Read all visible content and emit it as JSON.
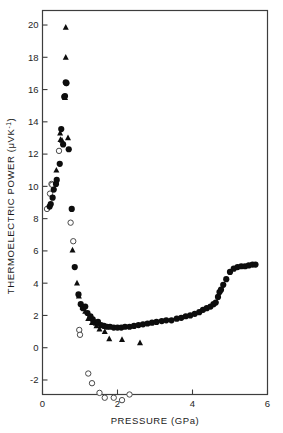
{
  "figure": {
    "title": "",
    "background": "#ffffff",
    "axis_color": "#3d3d3d",
    "marker_color": "#0d0d0d"
  },
  "axes": {
    "x": {
      "label": "PRESSURE (GPa)",
      "ticks": [
        0,
        2,
        4,
        6
      ],
      "tick_labels": [
        "0",
        "2",
        "4",
        "6"
      ],
      "min": 0,
      "max": 6
    },
    "y": {
      "label_text": "THERMOELECTRIC  POWER (",
      "label_unit_mu": "μ",
      "label_unit_rest": "VK",
      "label_unit_exp": "-1",
      "label_unit_close": ")",
      "label_full": "THERMOELECTRIC POWER (μVK⁻¹)",
      "ticks": [
        -2,
        0,
        2,
        4,
        6,
        8,
        10,
        12,
        14,
        16,
        18,
        20
      ],
      "tick_labels": [
        "-2",
        "0",
        "2",
        "4",
        "6",
        "8",
        "10",
        "12",
        "14",
        "16",
        "18",
        "20"
      ],
      "min": -2.9,
      "max": 20.9
    }
  },
  "chart_data": {
    "type": "scatter",
    "title": "",
    "xlabel": "PRESSURE (GPa)",
    "ylabel": "THERMOELECTRIC POWER (μVK⁻¹)",
    "xlim": [
      0,
      6
    ],
    "ylim": [
      -2.9,
      20.9
    ],
    "grid": false,
    "legend": "none",
    "series": [
      {
        "name": "filled-circles",
        "marker": "filled-circle",
        "color": "#0d0d0d",
        "points": [
          [
            0.19,
            8.75
          ],
          [
            0.22,
            8.9
          ],
          [
            0.27,
            9.3
          ],
          [
            0.3,
            9.8
          ],
          [
            0.36,
            10.15
          ],
          [
            0.38,
            10.4
          ],
          [
            0.46,
            11.4
          ],
          [
            0.5,
            13.55
          ],
          [
            0.55,
            12.6
          ],
          [
            0.58,
            15.55
          ],
          [
            0.6,
            15.6
          ],
          [
            0.62,
            16.45
          ],
          [
            0.64,
            16.4
          ],
          [
            0.7,
            12.3
          ],
          [
            0.78,
            8.6
          ],
          [
            0.86,
            5.0
          ],
          [
            0.96,
            3.3
          ],
          [
            1.02,
            2.7
          ],
          [
            1.08,
            2.45
          ],
          [
            1.14,
            2.55
          ],
          [
            1.2,
            2.15
          ],
          [
            1.28,
            1.95
          ],
          [
            1.34,
            1.75
          ],
          [
            1.4,
            1.55
          ],
          [
            1.48,
            1.6
          ],
          [
            1.56,
            1.4
          ],
          [
            1.64,
            1.35
          ],
          [
            1.72,
            1.3
          ],
          [
            1.8,
            1.3
          ],
          [
            1.9,
            1.25
          ],
          [
            2.0,
            1.25
          ],
          [
            2.1,
            1.25
          ],
          [
            2.2,
            1.3
          ],
          [
            2.32,
            1.3
          ],
          [
            2.44,
            1.35
          ],
          [
            2.56,
            1.4
          ],
          [
            2.68,
            1.45
          ],
          [
            2.8,
            1.5
          ],
          [
            2.92,
            1.55
          ],
          [
            3.04,
            1.6
          ],
          [
            3.18,
            1.65
          ],
          [
            3.3,
            1.7
          ],
          [
            3.44,
            1.7
          ],
          [
            3.58,
            1.8
          ],
          [
            3.7,
            1.85
          ],
          [
            3.82,
            1.95
          ],
          [
            3.94,
            2.0
          ],
          [
            4.06,
            2.1
          ],
          [
            4.18,
            2.2
          ],
          [
            4.28,
            2.35
          ],
          [
            4.38,
            2.45
          ],
          [
            4.48,
            2.55
          ],
          [
            4.56,
            2.7
          ],
          [
            4.62,
            2.8
          ],
          [
            4.68,
            3.15
          ],
          [
            4.72,
            3.45
          ],
          [
            4.76,
            3.6
          ],
          [
            4.82,
            3.9
          ],
          [
            4.9,
            4.25
          ],
          [
            5.0,
            4.7
          ],
          [
            5.1,
            4.9
          ],
          [
            5.2,
            5.0
          ],
          [
            5.3,
            5.05
          ],
          [
            5.4,
            5.05
          ],
          [
            5.5,
            5.1
          ],
          [
            5.6,
            5.15
          ],
          [
            5.68,
            5.15
          ]
        ]
      },
      {
        "name": "filled-triangles",
        "marker": "filled-triangle",
        "color": "#0d0d0d",
        "points": [
          [
            0.37,
            11.0
          ],
          [
            0.47,
            13.3
          ],
          [
            0.48,
            12.9
          ],
          [
            0.52,
            12.85
          ],
          [
            0.6,
            15.5
          ],
          [
            0.62,
            19.85
          ],
          [
            0.62,
            18.0
          ],
          [
            0.68,
            13.0
          ],
          [
            0.8,
            6.05
          ],
          [
            0.92,
            4.0
          ],
          [
            0.97,
            3.2
          ],
          [
            1.07,
            2.5
          ],
          [
            1.14,
            2.25
          ],
          [
            1.22,
            1.8
          ],
          [
            1.32,
            1.55
          ],
          [
            1.44,
            1.35
          ],
          [
            1.52,
            1.15
          ],
          [
            1.66,
            1.0
          ],
          [
            1.78,
            0.55
          ],
          [
            2.12,
            0.5
          ],
          [
            2.6,
            0.3
          ]
        ]
      },
      {
        "name": "open-circles",
        "marker": "open-circle",
        "color": "#ffffff",
        "points": [
          [
            0.12,
            8.6
          ],
          [
            0.2,
            9.55
          ],
          [
            0.24,
            10.15
          ],
          [
            0.26,
            10.1
          ],
          [
            0.44,
            12.2
          ],
          [
            0.63,
            16.4
          ],
          [
            0.75,
            7.75
          ],
          [
            0.82,
            6.6
          ],
          [
            0.98,
            1.1
          ],
          [
            1.0,
            0.8
          ],
          [
            1.22,
            -1.6
          ],
          [
            1.32,
            -2.2
          ],
          [
            1.52,
            -2.8
          ],
          [
            1.66,
            -3.1
          ],
          [
            1.9,
            -3.1
          ],
          [
            2.12,
            -3.25
          ],
          [
            2.32,
            -2.9
          ]
        ]
      }
    ]
  }
}
